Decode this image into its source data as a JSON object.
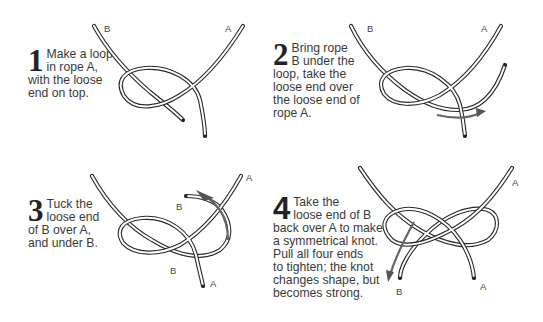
{
  "steps": [
    {
      "number": "1",
      "text": "Make a loop in rope A, with the loose end on top.",
      "lines": [
        "Make a loop",
        "in rope A,",
        "with the loose",
        "end on top."
      ],
      "labels": {
        "B": "B",
        "A": "A"
      }
    },
    {
      "number": "2",
      "text": "Bring rope B under the loop, take the loose end over the loose end of rope A.",
      "lines": [
        "Bring rope",
        "B under the",
        "loop, take the",
        "loose end over",
        "the loose end of",
        "rope A."
      ],
      "labels": {
        "B": "B",
        "A": "A"
      }
    },
    {
      "number": "3",
      "text": "Tuck the loose end of B over A, and under B.",
      "lines": [
        "Tuck the",
        "loose end",
        "of B over A,",
        "and under B."
      ],
      "labels": {
        "A_top": "A",
        "B_end": "B",
        "B_mid": "B",
        "A_end": "A"
      }
    },
    {
      "number": "4",
      "text": "Take the loose end of B back over A to make a symmetrical knot. Pull all four ends to tighten; the knot changes shape, but becomes strong.",
      "lines": [
        "Take the",
        "loose end of B",
        "back over A to make",
        "a symmetrical knot.",
        "Pull all four ends",
        "to tighten; the knot",
        "changes shape, but",
        "becomes strong."
      ],
      "labels": {
        "A_top": "A",
        "B_end": "B",
        "A_end": "A"
      }
    }
  ],
  "colors": {
    "rope_outline": "#2a2a2a",
    "arrow": "#666666",
    "text": "#3a3a3a",
    "background": "#ffffff"
  }
}
